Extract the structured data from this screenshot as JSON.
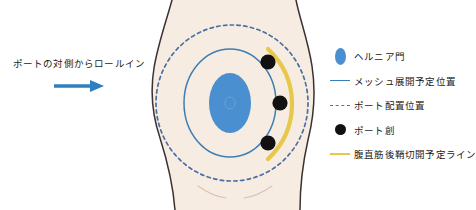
{
  "annotation": {
    "text": "ポートの対側からロールイン",
    "arrow_icon": "arrow-right-icon",
    "arrow_color": "#2e7fc1"
  },
  "figure": {
    "name": "abdomen-illustration",
    "skin_color": "#f7ece2",
    "outline_color": "#3a3230",
    "hernia_defect": {
      "label": "hernia-defect",
      "color": "#4a8fd0"
    },
    "mesh_outline": {
      "label": "mesh-deployment-outline",
      "color": "#3d7eb5"
    },
    "port_circle": {
      "label": "port-placement-circle",
      "color": "#4a6fa5"
    },
    "sheath_arc": {
      "label": "posterior-rectus-sheath-line",
      "color": "#e8c84a"
    },
    "ports": [
      {
        "label": "port-site-upper",
        "cx": 268,
        "cy": 62
      },
      {
        "label": "port-site-middle",
        "cx": 280,
        "cy": 103
      },
      {
        "label": "port-site-lower",
        "cx": 268,
        "cy": 143
      }
    ]
  },
  "legend": {
    "items": [
      {
        "marker": "ellipse",
        "icon": "hernia-defect-icon",
        "color": "#4a8fd0",
        "label": "ヘルニア門"
      },
      {
        "marker": "solid-line",
        "icon": "mesh-line-icon",
        "color": "#3d7eb5",
        "label": "メッシュ展開予定位置"
      },
      {
        "marker": "dashed-line",
        "icon": "port-circle-icon",
        "color": "#4a6fa5",
        "label": "ポート配置位置"
      },
      {
        "marker": "dot",
        "icon": "port-site-icon",
        "color": "#111111",
        "label": "ポート創"
      },
      {
        "marker": "solid-line",
        "icon": "sheath-line-icon",
        "color": "#e8c84a",
        "label": "腹直筋後鞘切開予定ライン"
      }
    ]
  }
}
